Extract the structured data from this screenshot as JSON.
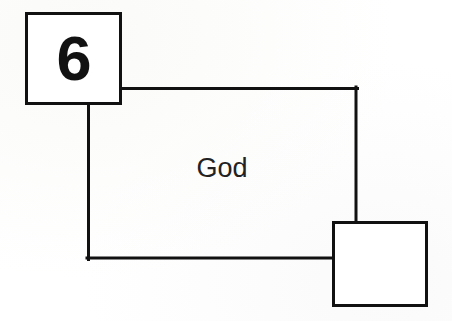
{
  "canvas": {
    "width": 452,
    "height": 321,
    "background_color": "#ffffff",
    "stroke_color": "#111111",
    "text_color": "#1b1b1b"
  },
  "diagram": {
    "type": "block-diagram",
    "title": "",
    "nodes": [
      {
        "id": "node-six",
        "name": "numbered-box-six",
        "label": "6",
        "shape": "rectangle",
        "x": 25,
        "y": 12,
        "width": 97,
        "height": 93,
        "stroke_width": 3,
        "fill": "#ffffff",
        "stroke": "#111111"
      },
      {
        "id": "node-region-god",
        "name": "region-outline-god",
        "label": "God",
        "shape": "open-polyline-region",
        "x": 88,
        "y": 88,
        "width": 268,
        "height": 170,
        "stroke_width": 3,
        "fill": "none",
        "stroke": "#111111"
      },
      {
        "id": "node-empty",
        "name": "empty-box",
        "label": "",
        "shape": "rectangle",
        "x": 332,
        "y": 221,
        "width": 96,
        "height": 86,
        "stroke_width": 3,
        "fill": "#ffffff",
        "stroke": "#111111"
      }
    ],
    "edges": [
      {
        "id": "edge-top",
        "name": "connector-six-to-top-right",
        "from": "node-six",
        "to": "node-region-god",
        "points": [
          [
            122,
            88
          ],
          [
            356,
            88
          ]
        ],
        "stroke_width": 3
      },
      {
        "id": "edge-right",
        "name": "connector-top-right-to-empty-box",
        "from": "node-region-god",
        "to": "node-empty",
        "points": [
          [
            356,
            88
          ],
          [
            356,
            221
          ]
        ],
        "stroke_width": 3
      },
      {
        "id": "edge-left",
        "name": "connector-six-to-bottom-left",
        "from": "node-six",
        "to": "node-region-god",
        "points": [
          [
            88,
            105
          ],
          [
            88,
            258
          ]
        ],
        "stroke_width": 3
      },
      {
        "id": "edge-bottom",
        "name": "connector-bottom-left-to-empty-box",
        "from": "node-region-god",
        "to": "node-empty",
        "points": [
          [
            88,
            258
          ],
          [
            332,
            258
          ]
        ],
        "stroke_width": 3
      }
    ]
  },
  "labels": {
    "six": "6",
    "god": "God"
  }
}
